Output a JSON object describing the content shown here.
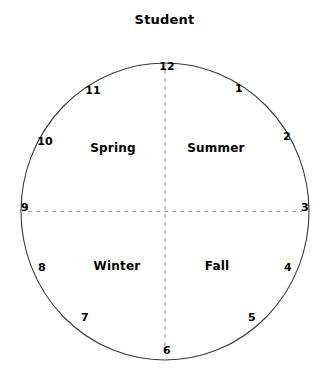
{
  "title": "Student",
  "colors": {
    "text": "#000000",
    "background": "#ffffff",
    "circle_stroke": "#3a3a3a",
    "dashed_line": "#9a9a9a"
  },
  "clock": {
    "center": {
      "x": 165,
      "y": 211
    },
    "radius": 145,
    "hours": [
      {
        "value": "12",
        "x": 167,
        "y": 66
      },
      {
        "value": "1",
        "x": 239,
        "y": 88
      },
      {
        "value": "2",
        "x": 287,
        "y": 136
      },
      {
        "value": "3",
        "x": 305,
        "y": 207
      },
      {
        "value": "4",
        "x": 288,
        "y": 267
      },
      {
        "value": "5",
        "x": 252,
        "y": 317
      },
      {
        "value": "6",
        "x": 167,
        "y": 350
      },
      {
        "value": "7",
        "x": 85,
        "y": 317
      },
      {
        "value": "8",
        "x": 42,
        "y": 267
      },
      {
        "value": "9",
        "x": 25,
        "y": 207
      },
      {
        "value": "10",
        "x": 45,
        "y": 141
      },
      {
        "value": "11",
        "x": 93,
        "y": 90
      }
    ],
    "quadrants": [
      {
        "label": "Spring",
        "x": 113,
        "y": 148
      },
      {
        "label": "Summer",
        "x": 216,
        "y": 148
      },
      {
        "label": "Winter",
        "x": 117,
        "y": 266
      },
      {
        "label": "Fall",
        "x": 217,
        "y": 266
      }
    ],
    "axes": [
      {
        "name": "vertical-axis",
        "style": "dashed"
      },
      {
        "name": "horizontal-axis",
        "style": "dashed"
      }
    ]
  }
}
